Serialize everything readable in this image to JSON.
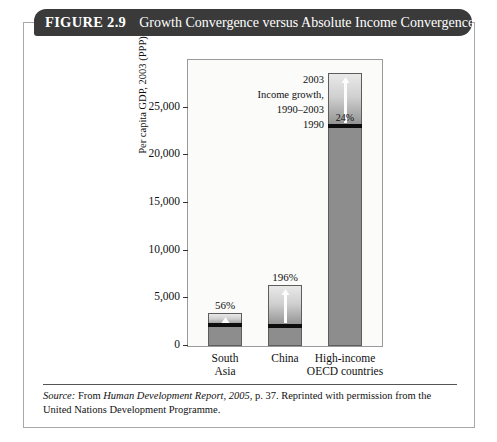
{
  "figure": {
    "number": "FIGURE 2.9",
    "title": "Growth Convergence versus Absolute Income Convergence",
    "banner_color": "#3a3a3a"
  },
  "source": {
    "label": "Source:",
    "text_before": " From ",
    "italic_work": "Human Development Report, 2005",
    "text_after": ", p. 37. Reprinted with permission from the United Nations Development Programme."
  },
  "annotation": {
    "line1": "2003",
    "line2": "Income growth,",
    "line3": "1990–2003",
    "line4": "1990"
  },
  "chart_data": {
    "type": "bar",
    "title": "Growth Convergence versus Absolute Income Convergence",
    "xlabel": "",
    "ylabel": "Per capita GDP, 2003 (PPP)",
    "ylim": [
      0,
      30000
    ],
    "yticks": [
      0,
      5000,
      10000,
      15000,
      20000,
      25000
    ],
    "ytick_labels": [
      "0",
      "5,000",
      "10,000",
      "15,000",
      "20,000",
      "25,000"
    ],
    "grid": false,
    "legend": "none",
    "categories": [
      "South Asia",
      "China",
      "High-income OECD countries"
    ],
    "category_lines": [
      [
        "South",
        "Asia"
      ],
      [
        "China",
        ""
      ],
      [
        "High-income",
        "OECD countries"
      ]
    ],
    "series": [
      {
        "name": "Income 1990",
        "values": [
          2200,
          2150,
          23100
        ]
      },
      {
        "name": "Income growth, 1990–2003",
        "values": [
          1230,
          4210,
          5540
        ]
      }
    ],
    "totals_2003": [
      3430,
      6360,
      28640
    ],
    "growth_labels": [
      "56%",
      "196%",
      "24%"
    ],
    "growth_label_position": [
      "above",
      "above",
      "inside"
    ]
  }
}
